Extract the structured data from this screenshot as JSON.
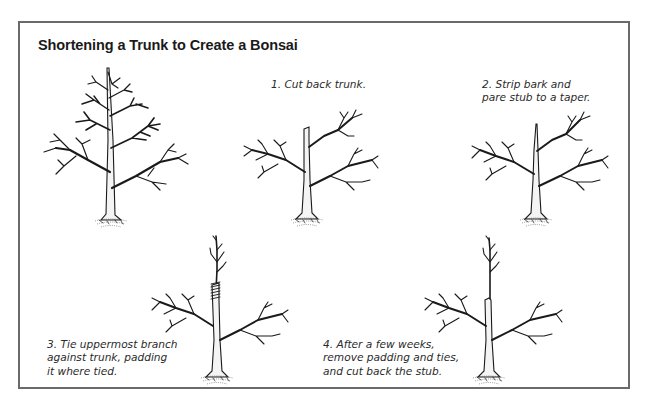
{
  "figure": {
    "title": "Shortening a Trunk to Create a Bonsai",
    "border_color": "#6a6a6a",
    "ink_color": "#1a1a1a"
  },
  "steps": [
    {
      "id": "original",
      "illustration": "tree-icon-original-full-trunk",
      "caption_lines": []
    },
    {
      "id": "step-1",
      "illustration": "tree-icon-trunk-cut-back",
      "caption_lines": [
        "1. Cut back trunk."
      ]
    },
    {
      "id": "step-2",
      "illustration": "tree-icon-stub-tapered",
      "caption_lines": [
        "2. Strip bark and",
        "pare stub to a taper."
      ]
    },
    {
      "id": "step-3",
      "illustration": "tree-icon-branch-tied-to-trunk",
      "caption_lines": [
        "3. Tie uppermost branch",
        "against trunk, padding",
        "it where tied."
      ]
    },
    {
      "id": "step-4",
      "illustration": "tree-icon-stub-removed",
      "caption_lines": [
        "4. After a few weeks,",
        "remove padding and ties,",
        "and cut back the stub."
      ]
    }
  ]
}
